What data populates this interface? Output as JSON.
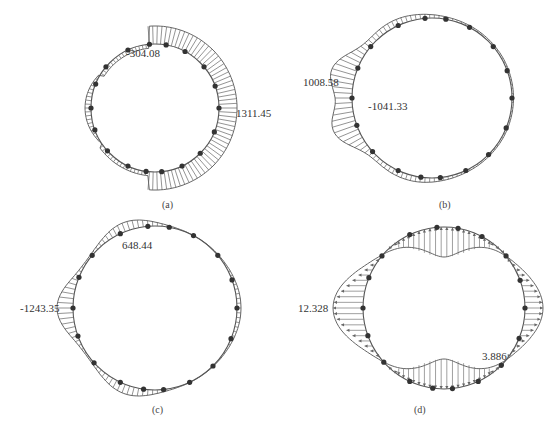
{
  "figure": {
    "panels": [
      {
        "id": "a",
        "caption": "(a)",
        "center": [
          155,
          108
        ],
        "radius": 64,
        "labels": [
          {
            "text": "-304.08",
            "x": 126,
            "y": 57
          },
          {
            "text": "1311.45",
            "x": 236,
            "y": 117
          }
        ]
      },
      {
        "id": "b",
        "caption": "(b)",
        "center": [
          432,
          98
        ],
        "radius": 80,
        "labels": [
          {
            "text": "1008.58",
            "x": 303,
            "y": 86
          },
          {
            "text": "-1041.33",
            "x": 368,
            "y": 110
          }
        ]
      },
      {
        "id": "c",
        "caption": "(c)",
        "center": [
          155,
          308
        ],
        "radius": 82,
        "labels": [
          {
            "text": "648.44",
            "x": 122,
            "y": 249
          },
          {
            "text": "-1243.35",
            "x": 20,
            "y": 312
          }
        ]
      },
      {
        "id": "d",
        "caption": "(d)",
        "center": [
          444,
          308
        ],
        "radius": 81,
        "labels": [
          {
            "text": "12.328",
            "x": 298,
            "y": 312
          },
          {
            "text": "3.886",
            "x": 482,
            "y": 360
          }
        ]
      }
    ],
    "colors": {
      "line": "#555555",
      "node": "#333333",
      "hatch": "#666666"
    }
  }
}
